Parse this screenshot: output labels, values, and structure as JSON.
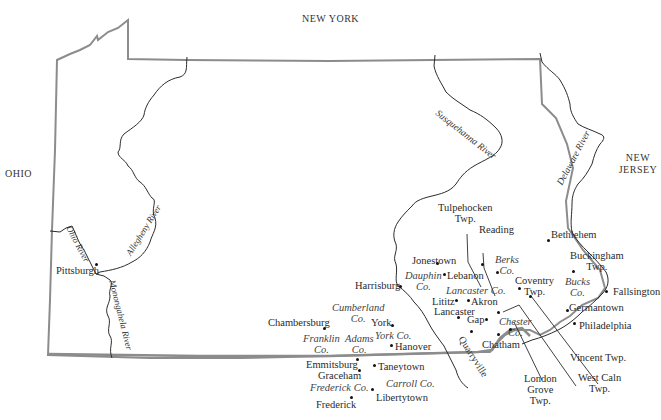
{
  "map": {
    "title": "Pennsylvania and vicinity",
    "states": {
      "new_york": "NEW YORK",
      "ohio": "OHIO",
      "new_jersey_1": "NEW",
      "new_jersey_2": "JERSEY"
    },
    "rivers": {
      "susquehanna": "Susquehanna River",
      "delaware": "Delaware River",
      "ohio": "Ohio River",
      "allegheny": "Allegheny River",
      "monongahela": "Monongahela River"
    },
    "places": {
      "pittsburgh": "Pittsburgh",
      "harrisburg": "Harrisburg",
      "jonestown": "Jonestown",
      "lebanon": "Lebanon",
      "tulpehocken_1": "Tulpehocken",
      "tulpehocken_2": "Twp.",
      "reading": "Reading",
      "bethlehem": "Bethlehem",
      "buckingham_1": "Buckingham",
      "buckingham_2": "Twp.",
      "fallsington": "Fallsington",
      "germantown": "Germantown",
      "philadelphia": "Philadelphia",
      "coventry_1": "Coventry",
      "coventry_2": "Twp.",
      "lititz": "Lititz",
      "akron": "Akron",
      "lancaster": "Lancaster",
      "gap": "Gap",
      "chatham": "Chatham",
      "quarryville": "Quarryville",
      "york": "York",
      "hanover": "Hanover",
      "chambersburg": "Chambersburg",
      "emmitsburg": "Emmitsburg",
      "graceham": "Graceham",
      "frederick": "Frederick",
      "taneytown": "Taneytown",
      "libertytown": "Libertytown",
      "vincent": "Vincent Twp.",
      "west_caln_1": "West Caln",
      "west_caln_2": "Twp.",
      "london_grove_1": "London",
      "london_grove_2": "Grove",
      "london_grove_3": "Twp."
    },
    "counties": {
      "berks_1": "Berks",
      "berks_2": "Co.",
      "bucks_1": "Bucks",
      "bucks_2": "Co.",
      "dauphin_1": "Dauphin",
      "dauphin_2": "Co.",
      "lancaster": "Lancaster Co.",
      "chester_1": "Chester",
      "chester_2": "Co.",
      "cumberland_1": "Cumberland",
      "cumberland_2": "Co.",
      "franklin_1": "Franklin",
      "franklin_2": "Co.",
      "adams_1": "Adams",
      "adams_2": "Co.",
      "york": "York Co.",
      "frederick": "Frederick Co.",
      "carroll": "Carroll Co."
    },
    "colors": {
      "border": "#8c8c8c",
      "river": "#2b2b2b",
      "text": "#2a2a2a"
    }
  }
}
